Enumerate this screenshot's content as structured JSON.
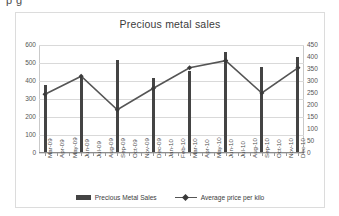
{
  "cut_off_header_text": "p                                                     g",
  "chart_data": {
    "type": "bar",
    "title": "Precious metal sales",
    "xlabel": "",
    "ylabel": "",
    "grid": true,
    "legend_position": "bottom",
    "categories": [
      "Mar-09",
      "Apr-09",
      "May-09",
      "Jun-09",
      "Jul-09",
      "Aug-09",
      "Sep-09",
      "Oct-09",
      "Nov-09",
      "Dec-09",
      "Jan-10",
      "Feb-10",
      "Mar-10",
      "Apr-10",
      "May-10",
      "Jun-10",
      "Jul-10",
      "Aug-10",
      "Sep-10",
      "Oct-10",
      "Nov-10",
      "Dec-10"
    ],
    "left_axis": {
      "name": "Precious Metal Sales",
      "ylim": [
        0,
        600
      ],
      "ticks": [
        0,
        100,
        200,
        300,
        400,
        500,
        600
      ]
    },
    "right_axis": {
      "name": "Average price per kilo",
      "ylim": [
        0,
        450
      ],
      "ticks": [
        0,
        50,
        100,
        150,
        200,
        250,
        300,
        350,
        400,
        450
      ]
    },
    "series": [
      {
        "name": "Precious Metal Sales",
        "type": "bar",
        "axis": "left",
        "color": "#444444",
        "values": [
          370,
          null,
          null,
          415,
          null,
          null,
          510,
          null,
          null,
          410,
          null,
          null,
          450,
          null,
          null,
          555,
          null,
          null,
          470,
          null,
          null,
          530
        ]
      },
      {
        "name": "Average price per kilo",
        "type": "line",
        "axis": "right",
        "color": "#555555",
        "marker": "diamond",
        "points": [
          {
            "category": "Mar-09",
            "value": 245
          },
          {
            "category": "Jun-09",
            "value": 320
          },
          {
            "category": "Sep-09",
            "value": 180
          },
          {
            "category": "Dec-09",
            "value": 270
          },
          {
            "category": "Mar-10",
            "value": 355
          },
          {
            "category": "Jun-10",
            "value": 385
          },
          {
            "category": "Sep-10",
            "value": 250
          },
          {
            "category": "Dec-10",
            "value": 355
          }
        ]
      }
    ],
    "legend": [
      {
        "label": "Precious Metal Sales",
        "marker": "bar"
      },
      {
        "label": "Average price per kilo",
        "marker": "line-diamond"
      }
    ]
  }
}
